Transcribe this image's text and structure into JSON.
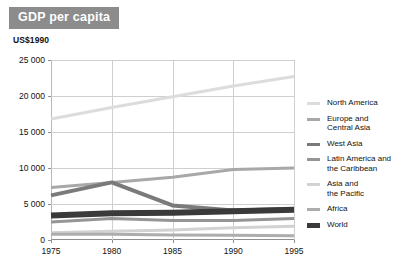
{
  "title": "GDP per capita",
  "unit_label": "US$1990",
  "colors": {
    "badge_bg": "#8c8c8c",
    "badge_text": "#ffffff",
    "grid": "#cfcfcf",
    "axis": "#8f8f8f",
    "background": "#ffffff"
  },
  "axes": {
    "y_ticks": [
      "0",
      "5 000",
      "10 000",
      "15 000",
      "20 000",
      "25 000"
    ],
    "y_tick_values": [
      0,
      5000,
      10000,
      15000,
      20000,
      25000
    ],
    "x_ticks": [
      "1975",
      "1980",
      "1985",
      "1990",
      "1995"
    ],
    "x_tick_values": [
      1975,
      1980,
      1985,
      1990,
      1995
    ]
  },
  "legend": {
    "position": "right",
    "items": [
      {
        "label": "North America",
        "color": "#dcdcdc",
        "width": 3
      },
      {
        "label": "Europe and\nCentral Asia",
        "color": "#a8a8a8",
        "width": 3
      },
      {
        "label": "West Asia",
        "color": "#7a7a7a",
        "width": 4
      },
      {
        "label": "Latin America and\nthe Caribbean",
        "color": "#959595",
        "width": 3
      },
      {
        "label": "Asia and\nthe Pacific",
        "color": "#d2d2d2",
        "width": 3
      },
      {
        "label": "Africa",
        "color": "#adadad",
        "width": 3
      },
      {
        "label": "World",
        "color": "#3a3a3a",
        "width": 6
      }
    ]
  },
  "chart_data": {
    "type": "line",
    "title": "GDP per capita",
    "xlabel": "",
    "ylabel": "US$1990",
    "x": [
      1975,
      1980,
      1985,
      1990,
      1995
    ],
    "xlim": [
      1975,
      1995
    ],
    "ylim": [
      0,
      25000
    ],
    "grid": true,
    "legend_position": "right",
    "series": [
      {
        "name": "North America",
        "color": "#dcdcdc",
        "width": 3,
        "values": [
          16800,
          18400,
          19900,
          21400,
          22700
        ]
      },
      {
        "name": "Europe and Central Asia",
        "color": "#a8a8a8",
        "width": 3,
        "values": [
          7300,
          8000,
          8700,
          9800,
          10000
        ]
      },
      {
        "name": "West Asia",
        "color": "#7a7a7a",
        "width": 4,
        "values": [
          6200,
          8000,
          4800,
          4100,
          4300
        ]
      },
      {
        "name": "Latin America and the Caribbean",
        "color": "#959595",
        "width": 3,
        "values": [
          2500,
          3000,
          2700,
          2700,
          3000
        ]
      },
      {
        "name": "Asia and the Pacific",
        "color": "#d2d2d2",
        "width": 3,
        "values": [
          1000,
          1200,
          1400,
          1700,
          1900
        ]
      },
      {
        "name": "Africa",
        "color": "#adadad",
        "width": 3,
        "values": [
          800,
          800,
          700,
          650,
          600
        ]
      },
      {
        "name": "World",
        "color": "#3a3a3a",
        "width": 6,
        "values": [
          3400,
          3700,
          3800,
          4000,
          4200
        ]
      }
    ]
  }
}
